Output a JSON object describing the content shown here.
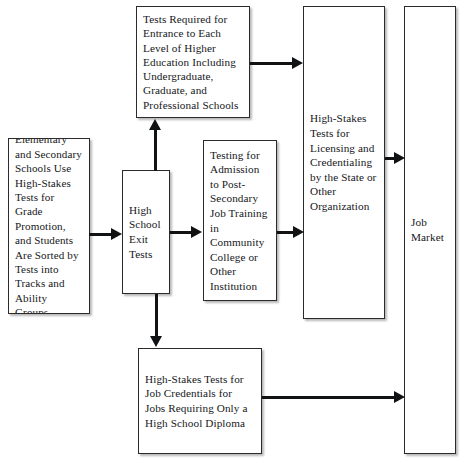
{
  "diagram": {
    "nodes": {
      "elementary": "Elementary and Secondary Schools Use High-Stakes Tests for Grade Promotion, and Students Are Sorted by Tests into Tracks and Ability Groups",
      "exit_tests": "High School Exit Tests",
      "higher_education": "Tests Required for Entrance to Each Level of Higher Education Including Undergraduate, Graduate, and Professional Schools",
      "post_secondary": "Testing for Admission to Post-Secondary Job Training in Community College or Other Institution",
      "licensing": "High-Stakes Tests for Licensing and Credentialing by the State or Other Organization",
      "job_credentials": "High-Stakes Tests for Job Credentials for Jobs Requiring Only a High School Diploma",
      "job_market": "Job Market"
    },
    "arrows": [
      {
        "name": "elementary-to-exit-tests",
        "direction": "right"
      },
      {
        "name": "exit-tests-to-higher-education",
        "direction": "up"
      },
      {
        "name": "exit-tests-to-post-secondary",
        "direction": "right"
      },
      {
        "name": "exit-tests-to-job-credentials",
        "direction": "down"
      },
      {
        "name": "higher-education-to-licensing",
        "direction": "right"
      },
      {
        "name": "post-secondary-to-licensing",
        "direction": "right"
      },
      {
        "name": "licensing-to-job-market",
        "direction": "right"
      },
      {
        "name": "job-credentials-to-job-market",
        "direction": "right"
      }
    ],
    "colors": {
      "box_border": "#2b2b2b",
      "arrow": "#111214",
      "text": "#16171a",
      "background": "#ffffff"
    }
  }
}
